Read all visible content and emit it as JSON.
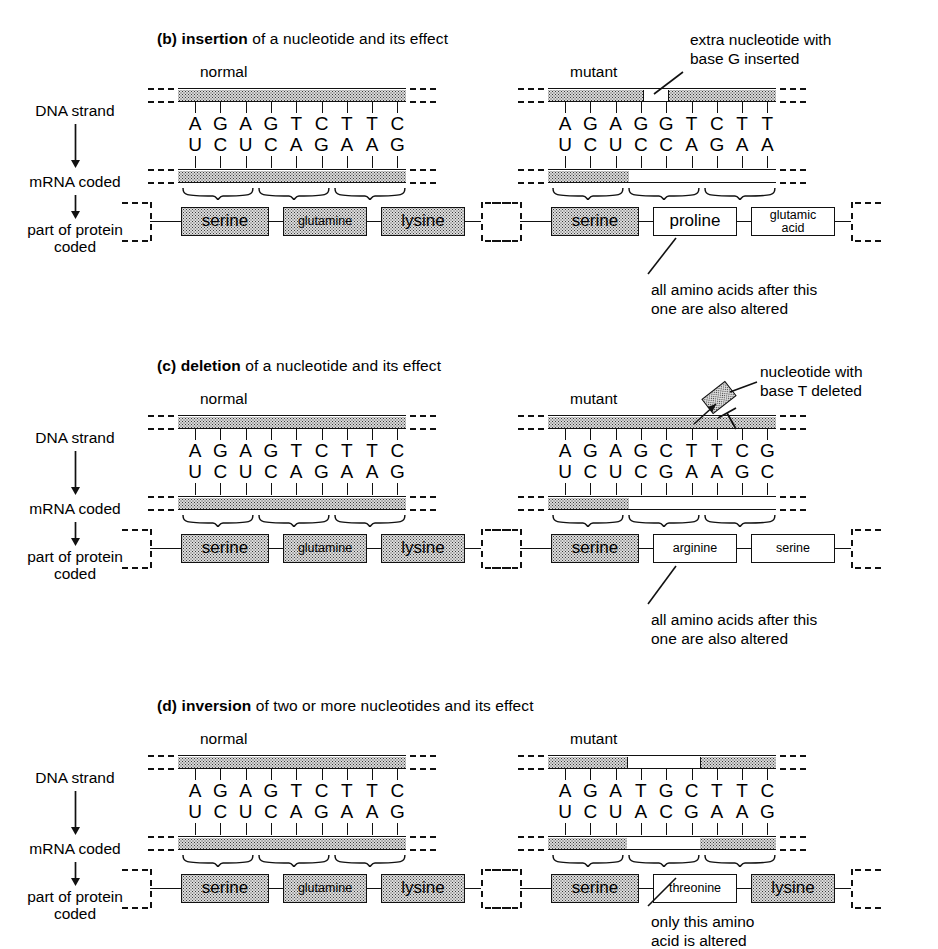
{
  "figure": {
    "row_labels": [
      {
        "text": "DNA strand"
      },
      {
        "text": "mRNA coded"
      },
      {
        "text": "part of protein"
      },
      {
        "text": "coded"
      }
    ],
    "arrow_icon": "down-arrow-icon",
    "column_headings": {
      "normal": "normal",
      "mutant": "mutant"
    },
    "normal": {
      "dna": [
        "A",
        "G",
        "A",
        "G",
        "T",
        "C",
        "T",
        "T",
        "C"
      ],
      "mrna": [
        "U",
        "C",
        "U",
        "C",
        "A",
        "G",
        "A",
        "A",
        "G"
      ],
      "protein": [
        {
          "name": "serine",
          "size": "lg",
          "shaded": true
        },
        {
          "name": "glutamine",
          "size": "sm",
          "shaded": true
        },
        {
          "name": "lysine",
          "size": "lg",
          "shaded": true
        }
      ]
    }
  },
  "panels": [
    {
      "id": "b",
      "tag": "(b)",
      "keyword": "insertion",
      "title_rest": "of a nucleotide and its effect",
      "mutant": {
        "dna": [
          "A",
          "G",
          "A",
          "G",
          "G",
          "T",
          "C",
          "T",
          "T"
        ],
        "mrna": [
          "U",
          "C",
          "U",
          "C",
          "C",
          "A",
          "G",
          "A",
          "A"
        ],
        "protein": [
          {
            "name": "serine",
            "size": "lg",
            "shaded": true
          },
          {
            "name": "proline",
            "size": "lg",
            "shaded": false
          },
          {
            "name": "glutamic acid",
            "line1": "glutamic",
            "line2": "acid",
            "size": "2l",
            "shaded": false
          }
        ]
      },
      "callouts": [
        {
          "id": "insert-callout",
          "line1": "extra nucleotide with",
          "line2": "base G inserted"
        },
        {
          "id": "altered-callout",
          "line1": "all amino acids after this",
          "line2": "one are also altered"
        }
      ]
    },
    {
      "id": "c",
      "tag": "(c)",
      "keyword": "deletion",
      "title_rest": "of a nucleotide and its effect",
      "mutant": {
        "dna": [
          "A",
          "G",
          "A",
          "G",
          "C",
          "T",
          "T",
          "C",
          "G"
        ],
        "mrna": [
          "U",
          "C",
          "U",
          "C",
          "G",
          "A",
          "A",
          "G",
          "C"
        ],
        "protein": [
          {
            "name": "serine",
            "size": "lg",
            "shaded": true
          },
          {
            "name": "arginine",
            "size": "sm",
            "shaded": false
          },
          {
            "name": "serine",
            "size": "sm",
            "shaded": false
          }
        ]
      },
      "deleted_base": "T",
      "callouts": [
        {
          "id": "delete-callout",
          "line1": "nucleotide with",
          "line2": "base T deleted"
        },
        {
          "id": "altered-callout",
          "line1": "all amino acids after this",
          "line2": "one are also altered"
        }
      ]
    },
    {
      "id": "d",
      "tag": "(d)",
      "keyword": "inversion",
      "title_rest": "of two or more nucleotides and its effect",
      "mutant": {
        "dna": [
          "A",
          "G",
          "A",
          "T",
          "G",
          "C",
          "T",
          "T",
          "C"
        ],
        "mrna": [
          "U",
          "C",
          "U",
          "A",
          "C",
          "G",
          "A",
          "A",
          "G"
        ],
        "protein": [
          {
            "name": "serine",
            "size": "lg",
            "shaded": true
          },
          {
            "name": "threonine",
            "size": "sm",
            "shaded": false
          },
          {
            "name": "lysine",
            "size": "lg",
            "shaded": true
          }
        ]
      },
      "callouts": [
        {
          "id": "only-altered-callout",
          "line1": "only this amino",
          "line2": "acid is altered"
        }
      ]
    }
  ],
  "colors": {
    "ink": "#000000",
    "stipple": "#dcdcdc",
    "paper": "#ffffff"
  }
}
